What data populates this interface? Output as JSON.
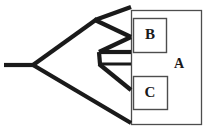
{
  "figure": {
    "kind": "phylogenetic-cladogram",
    "background_color": "#ffffff",
    "line_color": "#1a1a1a",
    "box_stroke_color": "#4d4d4d",
    "width": 211,
    "height": 130
  },
  "labels": {
    "clade_a": "A",
    "clade_b": "B",
    "clade_c": "C"
  },
  "boxes": {
    "outer": {
      "name": "A",
      "x": 131,
      "y": 10,
      "width": 71,
      "height": 115
    },
    "inner_upper": {
      "name": "B",
      "x": 133,
      "y": 18,
      "width": 34,
      "height": 35
    },
    "inner_lower": {
      "name": "C",
      "x": 133,
      "y": 76,
      "width": 35,
      "height": 34
    }
  },
  "tree": {
    "root_stem": {
      "x1": 5,
      "y1": 65,
      "x2": 33,
      "y2": 65
    },
    "nodes": [
      {
        "id": "root",
        "x": 33,
        "y": 65
      },
      {
        "id": "upper-node",
        "x": 96,
        "y": 20
      },
      {
        "id": "mid-node",
        "x": 100,
        "y": 64
      }
    ],
    "branches": [
      {
        "from": "root",
        "to": "upper-node"
      },
      {
        "from": "root",
        "to": "tip-5"
      },
      {
        "from": "upper-node",
        "to": "tip-1"
      },
      {
        "from": "upper-node",
        "to": "mid-node"
      },
      {
        "from": "mid-node",
        "to": "tip-2"
      },
      {
        "from": "mid-node",
        "to": "tip-3"
      },
      {
        "from": "mid-node",
        "to": "tip-4"
      }
    ],
    "tips": [
      {
        "id": "tip-1",
        "x": 131,
        "y": 8
      },
      {
        "id": "tip-2",
        "x": 131,
        "y": 36
      },
      {
        "id": "tip-3",
        "x": 131,
        "y": 52
      },
      {
        "id": "tip-4",
        "x": 131,
        "y": 64
      },
      {
        "id": "tip-5",
        "x": 131,
        "y": 89
      },
      {
        "id": "tip-6",
        "x": 131,
        "y": 122
      }
    ]
  }
}
